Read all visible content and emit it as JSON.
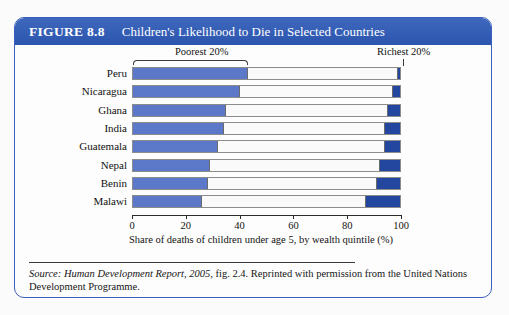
{
  "figure": {
    "number": "FIGURE 8.8",
    "title": "Children's Likelihood to Die in Selected Countries"
  },
  "annotations": {
    "poorest": "Poorest 20%",
    "richest": "Richest 20%"
  },
  "source": {
    "prefix": "Source: ",
    "italic_title": "Human Development Report, 2005,",
    "rest": " fig. 2.4. Reprinted with permission from the United Nations Development Programme."
  },
  "colors": {
    "title_bar": "#2f5cb6",
    "frame_border": "#3a5fbe",
    "poorest_segment": "#5b79c8",
    "richest_segment": "#23479f",
    "middle_segment": "#fafafa"
  },
  "chart_data": {
    "type": "bar",
    "title": "Children's Likelihood to Die in Selected Countries",
    "orientation": "horizontal",
    "stacked": true,
    "xlabel": "Share of deaths of children under age 5, by wealth quintile (%)",
    "ylabel": "",
    "xlim": [
      0,
      100
    ],
    "xticks": [
      0,
      20,
      40,
      60,
      80,
      100
    ],
    "xticklabels": [
      "0",
      "20",
      "40",
      "60",
      "80",
      "100"
    ],
    "grid": false,
    "legend": "annotated inline: Poorest 20% bracket at left, Richest 20% marker at right",
    "categories": [
      "Peru",
      "Nicaragua",
      "Ghana",
      "India",
      "Guatemala",
      "Nepal",
      "Benin",
      "Malawi"
    ],
    "series": [
      {
        "name": "Poorest 20%",
        "color": "#5b79c8",
        "values": [
          43,
          40,
          35,
          34,
          32,
          29,
          28,
          26
        ]
      },
      {
        "name": "Middle 60%",
        "color": "#fafafa",
        "values": [
          56,
          57,
          60,
          60,
          62,
          63,
          63,
          61
        ]
      },
      {
        "name": "Richest 20%",
        "color": "#23479f",
        "values": [
          1,
          3,
          5,
          6,
          6,
          8,
          9,
          13
        ]
      }
    ]
  }
}
